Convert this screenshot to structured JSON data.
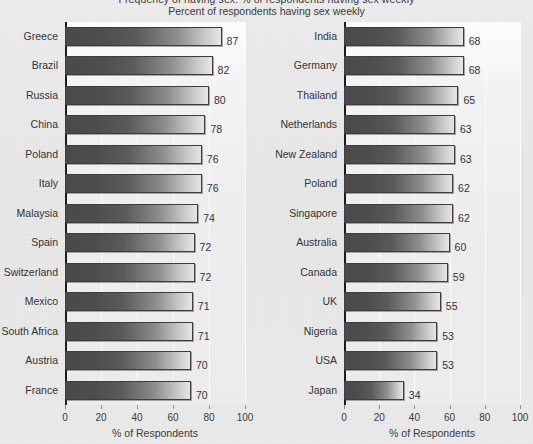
{
  "title": "Frequency of having sex: % of respondents having sex weekly",
  "subtitle": "Percent of respondents having sex weekly",
  "axis": {
    "xlabel": "% of Respondents",
    "ticks": [
      "0",
      "20",
      "40",
      "60",
      "80",
      "100"
    ]
  },
  "colors": {
    "bar_dark": "#4a4a4a",
    "bar_light": "#e6e6e6",
    "page_background": "#e9e9e9",
    "plot_background": "#f2f2f2",
    "axis": "#1d1d1d",
    "text": "#333333"
  },
  "chart_data": {
    "type": "bar",
    "title": "Frequency of having sex: % of respondents having sex weekly",
    "subtitle": "Percent of respondents having sex weekly",
    "orientation": "horizontal",
    "xlabel": "% of Respondents",
    "ylabel": "",
    "xlim": [
      0,
      100
    ],
    "xticks": [
      0,
      20,
      40,
      60,
      80,
      100
    ],
    "grid": true,
    "legend": "none",
    "panels": [
      {
        "name": "left",
        "categories": [
          "Greece",
          "Brazil",
          "Russia",
          "China",
          "Poland",
          "Italy",
          "Malaysia",
          "Spain",
          "Switzerland",
          "Mexico",
          "South Africa",
          "Austria",
          "France"
        ],
        "values": [
          87,
          82,
          80,
          78,
          76,
          76,
          74,
          72,
          72,
          71,
          71,
          70,
          70
        ]
      },
      {
        "name": "right",
        "categories": [
          "India",
          "Germany",
          "Thailand",
          "Netherlands",
          "New Zealand",
          "Poland",
          "Singapore",
          "Australia",
          "Canada",
          "UK",
          "Nigeria",
          "USA",
          "Japan"
        ],
        "values": [
          68,
          68,
          65,
          63,
          63,
          62,
          62,
          60,
          59,
          55,
          53,
          53,
          34
        ]
      }
    ]
  }
}
